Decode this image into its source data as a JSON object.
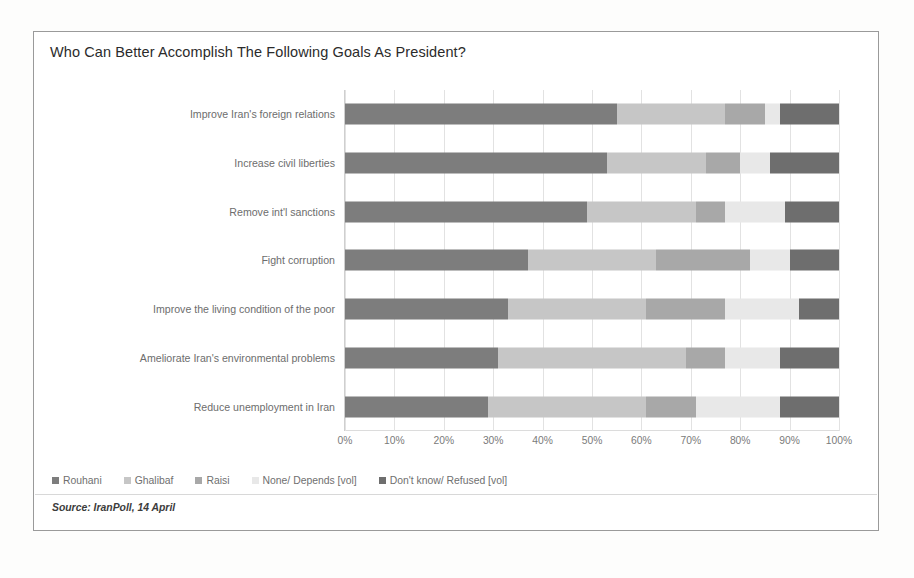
{
  "chart": {
    "title": "Who Can Better Accomplish The Following Goals As President?",
    "source": "Source: IranPoll, 14 April"
  },
  "legend": {
    "position": "bottom-left",
    "items": [
      {
        "label": "Rouhani",
        "marker": "square-swatch-icon",
        "color": "#7d7d7d"
      },
      {
        "label": "Ghalibaf",
        "marker": "square-swatch-icon",
        "color": "#c6c6c6"
      },
      {
        "label": "Raisi",
        "marker": "square-swatch-icon",
        "color": "#a8a8a8"
      },
      {
        "label": "None/ Depends [vol]",
        "marker": "square-swatch-icon",
        "color": "#e8e8e8"
      },
      {
        "label": "Don't know/ Refused [vol]",
        "marker": "square-swatch-icon",
        "color": "#6e6e6e"
      }
    ]
  },
  "axis": {
    "ticks": [
      "0%",
      "10%",
      "20%",
      "30%",
      "40%",
      "50%",
      "60%",
      "70%",
      "80%",
      "90%",
      "100%"
    ]
  },
  "chart_data": {
    "type": "bar",
    "orientation": "horizontal",
    "stacked": true,
    "stack_total": 100,
    "title": "Who Can Better Accomplish The Following Goals As President?",
    "xlabel": "",
    "ylabel": "",
    "xlim": [
      0,
      100
    ],
    "x_tick_labels": [
      "0%",
      "10%",
      "20%",
      "30%",
      "40%",
      "50%",
      "60%",
      "70%",
      "80%",
      "90%",
      "100%"
    ],
    "grid": true,
    "grid_axis": "x",
    "legend_position": "bottom-left",
    "units": "percent",
    "categories": [
      "Improve Iran's foreign relations",
      "Increase civil liberties",
      "Remove int'l sanctions",
      "Fight corruption",
      "Improve the living condition of the poor",
      "Ameliorate Iran's environmental problems",
      "Reduce unemployment in Iran"
    ],
    "series": [
      {
        "name": "Rouhani",
        "color": "#7d7d7d",
        "values": [
          55,
          53,
          49,
          37,
          33,
          31,
          29
        ]
      },
      {
        "name": "Ghalibaf",
        "color": "#c6c6c6",
        "values": [
          22,
          20,
          22,
          26,
          28,
          38,
          32
        ]
      },
      {
        "name": "Raisi",
        "color": "#a8a8a8",
        "values": [
          8,
          7,
          6,
          19,
          16,
          8,
          10
        ]
      },
      {
        "name": "None/ Depends [vol]",
        "color": "#e8e8e8",
        "values": [
          3,
          6,
          12,
          8,
          15,
          11,
          17
        ]
      },
      {
        "name": "Don't know/ Refused [vol]",
        "color": "#6e6e6e",
        "values": [
          12,
          14,
          11,
          10,
          8,
          12,
          12
        ]
      }
    ]
  }
}
